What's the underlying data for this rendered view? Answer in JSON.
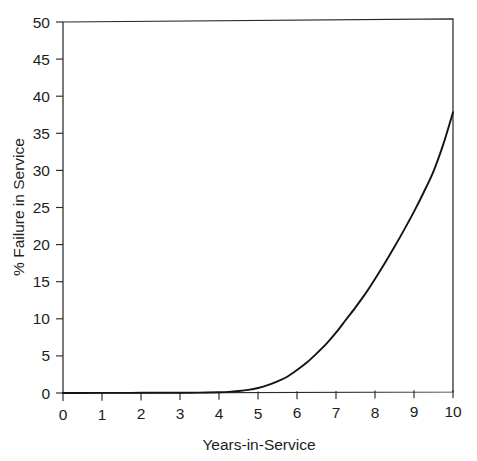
{
  "chart_data": {
    "type": "line",
    "title": "",
    "xlabel": "Years-in-Service",
    "ylabel": "% Failure in Service",
    "xlim": [
      0,
      10
    ],
    "ylim": [
      0,
      50
    ],
    "xticks": [
      "0",
      "1",
      "2",
      "3",
      "4",
      "5",
      "6",
      "7",
      "8",
      "9",
      "10"
    ],
    "yticks": [
      "0",
      "5",
      "10",
      "15",
      "20",
      "25",
      "30",
      "35",
      "40",
      "45",
      "50"
    ],
    "grid": false,
    "legend": null,
    "frame": "box",
    "tick_direction": "out",
    "series": [
      {
        "name": "Failure in Service",
        "color": "#141414",
        "x": [
          0,
          0.5,
          1,
          1.5,
          2,
          2.5,
          3,
          3.5,
          4,
          4.25,
          4.5,
          4.75,
          5,
          5.25,
          5.5,
          5.75,
          6,
          6.25,
          6.5,
          6.75,
          7,
          7.25,
          7.5,
          7.75,
          8,
          8.25,
          8.5,
          8.75,
          9,
          9.25,
          9.5,
          9.75,
          10
        ],
        "y": [
          0,
          0,
          0,
          0,
          0,
          0,
          0,
          0,
          0.05,
          0.1,
          0.2,
          0.35,
          0.6,
          1.0,
          1.5,
          2.1,
          3.0,
          4.0,
          5.2,
          6.5,
          8.0,
          9.7,
          11.4,
          13.2,
          15.2,
          17.3,
          19.5,
          21.8,
          24.2,
          26.8,
          29.6,
          33.2,
          37.5
        ]
      }
    ],
    "annotations": []
  }
}
